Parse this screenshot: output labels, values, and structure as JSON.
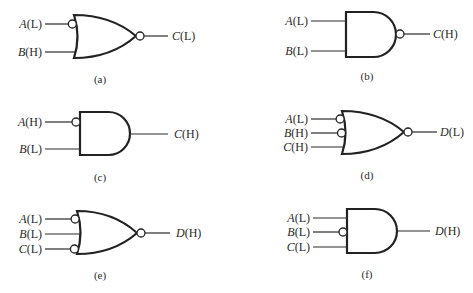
{
  "figure": {
    "gates": [
      {
        "id": "a",
        "type": "OR",
        "caption": "(a)",
        "output_bubble": true,
        "inputs": [
          {
            "var": "A",
            "level": "(L)",
            "bubble": true
          },
          {
            "var": "B",
            "level": "(H)",
            "bubble": false
          }
        ],
        "output": {
          "var": "C",
          "level": "(L)"
        }
      },
      {
        "id": "b",
        "type": "AND",
        "caption": "(b)",
        "output_bubble": true,
        "inputs": [
          {
            "var": "A",
            "level": "(L)",
            "bubble": false
          },
          {
            "var": "B",
            "level": "(L)",
            "bubble": false
          }
        ],
        "output": {
          "var": "C",
          "level": "(H)"
        }
      },
      {
        "id": "c",
        "type": "AND",
        "caption": "(c)",
        "output_bubble": false,
        "inputs": [
          {
            "var": "A",
            "level": "(H)",
            "bubble": true
          },
          {
            "var": "B",
            "level": "(L)",
            "bubble": false
          }
        ],
        "output": {
          "var": "C",
          "level": "(H)"
        }
      },
      {
        "id": "d",
        "type": "OR",
        "caption": "(d)",
        "output_bubble": true,
        "inputs": [
          {
            "var": "A",
            "level": "(L)",
            "bubble": true
          },
          {
            "var": "B",
            "level": "(H)",
            "bubble": true
          },
          {
            "var": "C",
            "level": "(H)",
            "bubble": false
          }
        ],
        "output": {
          "var": "D",
          "level": "(L)"
        }
      },
      {
        "id": "e",
        "type": "OR",
        "caption": "(e)",
        "output_bubble": true,
        "inputs": [
          {
            "var": "A",
            "level": "(L)",
            "bubble": true
          },
          {
            "var": "B",
            "level": "(L)",
            "bubble": false
          },
          {
            "var": "C",
            "level": "(L)",
            "bubble": true
          }
        ],
        "output": {
          "var": "D",
          "level": "(H)"
        }
      },
      {
        "id": "f",
        "type": "AND",
        "caption": "(f)",
        "output_bubble": false,
        "inputs": [
          {
            "var": "A",
            "level": "(L)",
            "bubble": false
          },
          {
            "var": "B",
            "level": "(L)",
            "bubble": true
          },
          {
            "var": "C",
            "level": "(L)",
            "bubble": false
          }
        ],
        "output": {
          "var": "D",
          "level": "(H)"
        }
      }
    ]
  }
}
